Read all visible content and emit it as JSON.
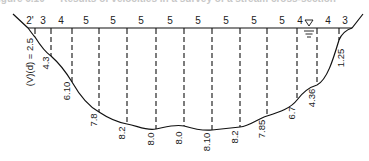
{
  "caption": "igure 6.10 — Results of velocities in a survey of a stream cross-section",
  "diagram": {
    "type": "stream cross-section with verticals",
    "water_surface_y": 28,
    "width_labels": [
      {
        "text": "2'",
        "x": 30
      },
      {
        "text": "3",
        "x": 43
      },
      {
        "text": "4",
        "x": 61
      },
      {
        "text": "5",
        "x": 86
      },
      {
        "text": "5",
        "x": 113
      },
      {
        "text": "5",
        "x": 141
      },
      {
        "text": "5",
        "x": 170
      },
      {
        "text": "5",
        "x": 198
      },
      {
        "text": "5",
        "x": 226
      },
      {
        "text": "5",
        "x": 254
      },
      {
        "text": "5",
        "x": 282
      },
      {
        "text": "4",
        "x": 300
      },
      {
        "text": "4",
        "x": 328
      },
      {
        "text": "3",
        "x": 345
      }
    ],
    "verticals": [
      {
        "x": 35,
        "bottom": 37,
        "label": "(V)(d) = 2.5",
        "label_x": 33,
        "label_y": 62
      },
      {
        "x": 51,
        "bottom": 56,
        "label": "4.3",
        "label_x": 49,
        "label_y": 63
      },
      {
        "x": 72,
        "bottom": 82,
        "label": "6.10",
        "label_x": 70,
        "label_y": 91
      },
      {
        "x": 99,
        "bottom": 112,
        "label": "7.8",
        "label_x": 97,
        "label_y": 120
      },
      {
        "x": 127,
        "bottom": 124,
        "label": "8.2",
        "label_x": 125,
        "label_y": 133
      },
      {
        "x": 156,
        "bottom": 129,
        "label": "8.0",
        "label_x": 154,
        "label_y": 139
      },
      {
        "x": 184,
        "bottom": 126,
        "label": "8.0",
        "label_x": 182,
        "label_y": 138
      },
      {
        "x": 212,
        "bottom": 130,
        "label": "8.10",
        "label_x": 210,
        "label_y": 142
      },
      {
        "x": 240,
        "bottom": 127,
        "label": "8.2",
        "label_x": 238,
        "label_y": 137
      },
      {
        "x": 267,
        "bottom": 116,
        "label": "7.85",
        "label_x": 265,
        "label_y": 129
      },
      {
        "x": 297,
        "bottom": 100,
        "label": "6.7",
        "label_x": 295,
        "label_y": 113
      },
      {
        "x": 317,
        "bottom": 85,
        "label": "4.36",
        "label_x": 315,
        "label_y": 98
      },
      {
        "x": 339,
        "bottom": 40,
        "label": "1.25",
        "label_x": 344,
        "label_y": 58
      }
    ],
    "water_symbol": {
      "x": 309,
      "y": 22,
      "glyph": "▽"
    }
  }
}
